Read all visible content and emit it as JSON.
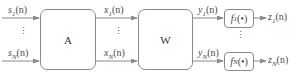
{
  "diagram": {
    "inputs": [
      {
        "label": "s1(n)",
        "base": "s",
        "sub": "1"
      },
      {
        "label": "sN(n)",
        "base": "s",
        "sub": "N"
      }
    ],
    "mixing_block": {
      "label": "A"
    },
    "mixed_signals": [
      {
        "label": "x1(n)",
        "base": "x",
        "sub": "1"
      },
      {
        "label": "xN(n)",
        "base": "x",
        "sub": "N"
      }
    ],
    "separation_block": {
      "label": "W"
    },
    "separated_signals": [
      {
        "label": "y1(n)",
        "base": "y",
        "sub": "1"
      },
      {
        "label": "yN(n)",
        "base": "y",
        "sub": "N"
      }
    ],
    "nonlinear_blocks": [
      {
        "label": "f1(•)",
        "base": "f",
        "sub": "1",
        "arg": "(•)"
      },
      {
        "label": "fN(•)",
        "base": "f",
        "sub": "N",
        "arg": "(•)"
      }
    ],
    "outputs": [
      {
        "label": "z1(n)",
        "base": "z",
        "sub": "1"
      },
      {
        "label": "zN(n)",
        "base": "z",
        "sub": "N"
      }
    ],
    "ellipsis": "⋮",
    "arg_n": "(n)",
    "line_color": "#8a8a8a"
  }
}
